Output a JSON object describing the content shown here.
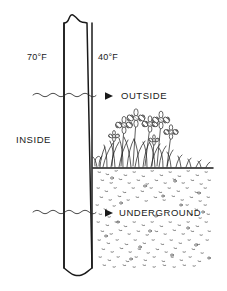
{
  "diagram": {
    "background_color": "#ffffff",
    "ink_color": "#1a1a1a",
    "labels": {
      "temp_inside": "70°F",
      "temp_outside": "40°F",
      "side_inside": "INSIDE",
      "zone_outside": "OUTSIDE",
      "zone_underground": "UNDERGROUND"
    },
    "elements": {
      "wall": "wall-column",
      "wall_break_top": "break-symbol-top",
      "wall_break_bottom": "break-symbol-bottom",
      "arrow_outside": "wavy-arrow-outside",
      "arrow_underground": "wavy-arrow-underground",
      "ground_line": "ground-surface-line",
      "soil": "underground-stipple-fill",
      "vegetation": "flower-cluster"
    }
  }
}
